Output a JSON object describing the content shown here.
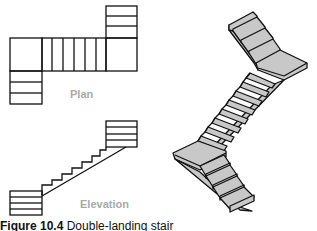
{
  "figure": {
    "caption_label": "Figure 10.4",
    "caption_text": "Double-landing stair"
  },
  "views": {
    "plan": {
      "label": "Plan"
    },
    "elevation": {
      "label": "Elevation"
    },
    "isometric": {
      "label": ""
    }
  },
  "colors": {
    "line": "#111111",
    "fill_gray": "#c8c8c8",
    "label_gray": "#a9a9a9",
    "background": "#ffffff"
  }
}
